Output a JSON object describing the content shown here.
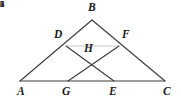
{
  "figure": {
    "stroke_color": "#3c3c3c",
    "faint_stroke_color": "#9a9a9a",
    "background_color": "#ffffff",
    "label_color": "#1a1a1a",
    "angle_label_color": "#2a2a2a"
  },
  "points": [
    {
      "name": "A",
      "label": "A",
      "x": 20,
      "y": 81,
      "label_x": 17,
      "label_y": 86
    },
    {
      "name": "B",
      "label": "B",
      "x": 92,
      "y": 20,
      "label_x": 88,
      "label_y": 2
    },
    {
      "name": "C",
      "label": "C",
      "x": 165,
      "y": 81,
      "label_x": 163,
      "label_y": 86
    },
    {
      "name": "D",
      "label": "D",
      "x": 66,
      "y": 46,
      "label_x": 54,
      "label_y": 29
    },
    {
      "name": "E",
      "label": "E",
      "x": 114,
      "y": 81,
      "label_x": 109,
      "label_y": 86
    },
    {
      "name": "F",
      "label": "F",
      "x": 119,
      "y": 46,
      "label_x": 122,
      "label_y": 29
    },
    {
      "name": "G",
      "label": "G",
      "x": 68,
      "y": 81,
      "label_x": 62,
      "label_y": 86
    },
    {
      "name": "H",
      "label": "H",
      "x": 92,
      "y": 59,
      "label_x": 84,
      "label_y": 43
    }
  ],
  "segments": [
    {
      "name": "side-AB",
      "from": "A",
      "to": "B",
      "style": "solid"
    },
    {
      "name": "side-BC",
      "from": "B",
      "to": "C",
      "style": "solid"
    },
    {
      "name": "base-AC",
      "from": "A",
      "to": "C",
      "style": "solid"
    },
    {
      "name": "cevian-DE",
      "from": "D",
      "to": "E",
      "style": "solid"
    },
    {
      "name": "cevian-FG",
      "from": "F",
      "to": "G",
      "style": "solid"
    },
    {
      "name": "segment-DF",
      "from": "D",
      "to": "F",
      "style": "faint"
    }
  ],
  "angle_labels": [
    {
      "name": "angle-1",
      "label": "1",
      "x": 71,
      "y": 34
    },
    {
      "name": "angle-2",
      "label": "2",
      "x": 105,
      "y": 34
    },
    {
      "name": "angle-3",
      "label": "3",
      "x": 82,
      "y": 69
    },
    {
      "name": "angle-4",
      "label": "4",
      "x": 95,
      "y": 69
    },
    {
      "name": "angle-5",
      "label": "5",
      "x": 65,
      "y": 42
    },
    {
      "name": "angle-6",
      "label": "6",
      "x": 112,
      "y": 42
    }
  ]
}
